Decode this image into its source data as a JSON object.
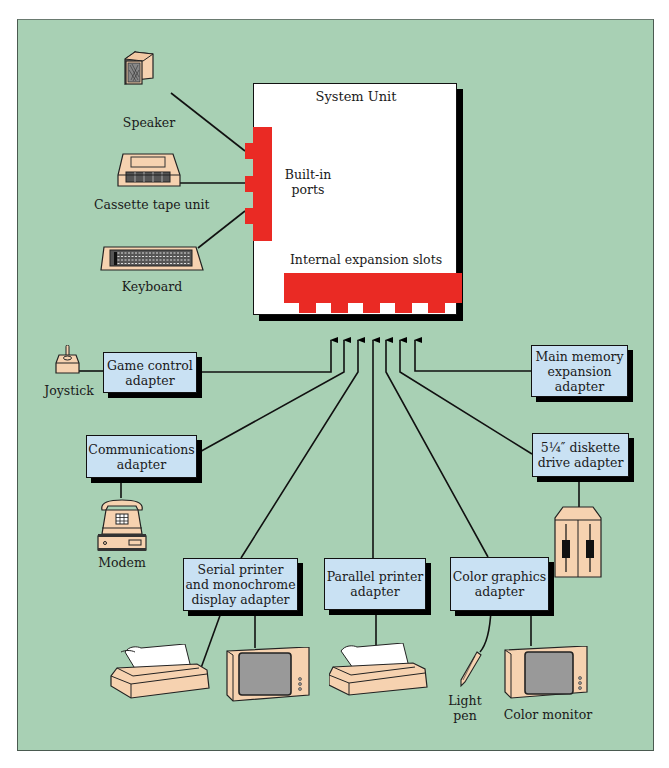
{
  "diagram": {
    "colors": {
      "background": "#a8d0b4",
      "adapter_box": "#c9e1f3",
      "ports_red": "#ea2a24",
      "device_beige": "#f6d2b0",
      "system_unit": "#ffffff"
    },
    "system_unit": {
      "title": "System Unit",
      "builtin_ports_label": "Built-in\nports",
      "expansion_slots_label": "Internal expansion slots",
      "expansion_slot_count": 5,
      "builtin_port_count": 3
    },
    "builtin_devices": [
      {
        "label": "Speaker",
        "icon": "speaker-icon"
      },
      {
        "label": "Cassette tape unit",
        "icon": "cassette-tape-icon"
      },
      {
        "label": "Keyboard",
        "icon": "keyboard-icon"
      }
    ],
    "adapters": [
      {
        "id": "game",
        "label": "Game control\nadapter",
        "devices": [
          "Joystick"
        ]
      },
      {
        "id": "comm",
        "label": "Communications\nadapter",
        "devices": [
          "Modem"
        ]
      },
      {
        "id": "serial",
        "label": "Serial printer\nand monochrome\ndisplay adapter",
        "devices": [
          "printer",
          "monochrome monitor"
        ]
      },
      {
        "id": "parallel",
        "label": "Parallel printer\nadapter",
        "devices": [
          "printer"
        ]
      },
      {
        "id": "color",
        "label": "Color graphics\nadapter",
        "devices": [
          "Light\npen",
          "Color monitor"
        ]
      },
      {
        "id": "diskette",
        "label": "5¼″ diskette\ndrive adapter",
        "devices": [
          "diskette drive"
        ]
      },
      {
        "id": "memory",
        "label": "Main memory\nexpansion\nadapter",
        "devices": []
      }
    ],
    "device_labels": {
      "joystick": "Joystick",
      "modem": "Modem",
      "light_pen": "Light\npen",
      "color_monitor": "Color monitor"
    }
  }
}
